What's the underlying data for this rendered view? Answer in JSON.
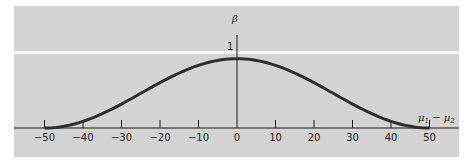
{
  "chart_data": {
    "type": "line",
    "title": "",
    "xlabel": "μ1 − μ2",
    "ylabel": "β",
    "y_tick_label": "1",
    "x_ticks": [
      -50,
      -40,
      -30,
      -20,
      -10,
      0,
      10,
      20,
      30,
      40,
      50
    ],
    "x_tick_labels": [
      "−50",
      "−40",
      "−30",
      "−20",
      "−10",
      "0",
      "10",
      "20",
      "30",
      "40",
      "50"
    ],
    "xlim": [
      -50,
      50
    ],
    "ylim": [
      0,
      1
    ],
    "grid": false,
    "legend": null,
    "series": [
      {
        "name": "beta (OC curve)",
        "x": [
          -50,
          -45,
          -40,
          -35,
          -30,
          -25,
          -20,
          -15,
          -10,
          -5,
          0,
          5,
          10,
          15,
          20,
          25,
          30,
          35,
          40,
          45,
          50
        ],
        "values": [
          0.0,
          0.03,
          0.11,
          0.22,
          0.36,
          0.51,
          0.65,
          0.78,
          0.89,
          0.96,
          0.99,
          0.96,
          0.89,
          0.78,
          0.65,
          0.51,
          0.36,
          0.22,
          0.11,
          0.03,
          0.0
        ]
      }
    ]
  },
  "labels": {
    "beta": "β",
    "one": "1",
    "mu_diff_mu1": "μ",
    "mu_diff_sub1": "1",
    "mu_diff_minus": " − ",
    "mu_diff_mu2": "μ",
    "mu_diff_sub2": "2"
  },
  "colors": {
    "panel": "#d3d3d3",
    "curve": "#2e2e2e",
    "axis": "#1a1a1a"
  }
}
